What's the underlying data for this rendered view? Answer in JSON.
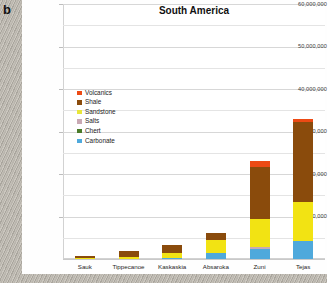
{
  "panel": {
    "label": "b"
  },
  "chart_data": {
    "type": "bar",
    "subtype": "stacked",
    "title": "South America",
    "xlabel": "",
    "ylabel": "",
    "ylim": [
      0,
      60000000
    ],
    "ytick_values": [
      0,
      10000000,
      20000000,
      30000000,
      40000000,
      50000000,
      60000000
    ],
    "ytick_labels": [
      "",
      "10,000,000",
      "20,000,000",
      "30,000,000",
      "40,000,000",
      "50,000,000",
      "60,000,000"
    ],
    "grid": true,
    "legend_position": "inside-upper-left",
    "categories": [
      "Sauk",
      "Tippecanoe",
      "Kaskaskia",
      "Absaroka",
      "Zuni",
      "Tejas"
    ],
    "series": [
      {
        "name": "Carbonate",
        "color": "#4FA9DC",
        "values": [
          0,
          0,
          200000,
          1500000,
          2400000,
          4300000
        ]
      },
      {
        "name": "Chert",
        "color": "#4A7B29",
        "values": [
          0,
          0,
          0,
          0,
          0,
          0
        ]
      },
      {
        "name": "Salts",
        "color": "#C9A9B4",
        "values": [
          0,
          0,
          0,
          0,
          400000,
          0
        ]
      },
      {
        "name": "Sandstone",
        "color": "#F2E313",
        "values": [
          200000,
          500000,
          1100000,
          3000000,
          6700000,
          9000000
        ]
      },
      {
        "name": "Shale",
        "color": "#8A4B0C",
        "values": [
          600000,
          1300000,
          2000000,
          1600000,
          12100000,
          18900000
        ]
      },
      {
        "name": "Volcanics",
        "color": "#ED4A14",
        "values": [
          0,
          0,
          0,
          0,
          1400000,
          800000
        ]
      }
    ],
    "totals": [
      800000,
      1800000,
      3300000,
      6100000,
      23000000,
      33000000
    ]
  },
  "legend": {
    "items": [
      {
        "label": "Volcanics",
        "color": "#ED4A14"
      },
      {
        "label": "Shale",
        "color": "#8A4B0C"
      },
      {
        "label": "Sandstone",
        "color": "#E8E63A"
      },
      {
        "label": "Salts",
        "color": "#C9A9B4"
      },
      {
        "label": "Chert",
        "color": "#4A7B29"
      },
      {
        "label": "Carbonate",
        "color": "#4FA9DC"
      }
    ]
  }
}
